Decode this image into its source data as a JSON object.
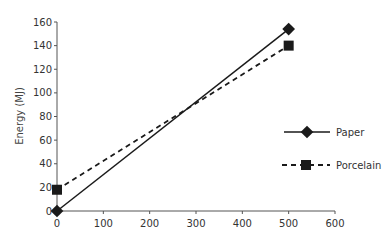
{
  "chart_data": {
    "type": "line",
    "title": "",
    "xlabel": "",
    "ylabel": "Energy (MJ)",
    "xlim": [
      0,
      600
    ],
    "ylim": [
      0,
      160
    ],
    "x_ticks": [
      0,
      100,
      200,
      300,
      400,
      500,
      600
    ],
    "y_ticks": [
      0,
      20,
      40,
      60,
      80,
      100,
      120,
      140,
      160
    ],
    "grid": false,
    "legend_position": "right",
    "series": [
      {
        "name": "Paper",
        "marker": "diamond",
        "line": "solid",
        "x": [
          0,
          500
        ],
        "values": [
          0,
          154
        ]
      },
      {
        "name": "Porcelain",
        "marker": "square",
        "line": "dashed",
        "x": [
          0,
          500
        ],
        "values": [
          18,
          140
        ]
      }
    ]
  },
  "legend": {
    "paper": "Paper",
    "porcelain": "Porcelain"
  },
  "colors": {
    "line": "#1a1a1a",
    "axis": "#555555"
  }
}
